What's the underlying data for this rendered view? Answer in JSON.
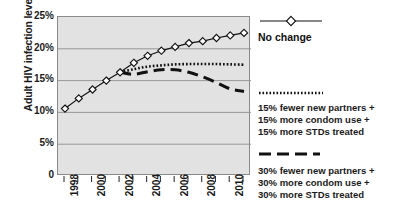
{
  "chart_data": {
    "type": "line",
    "title": "",
    "xlabel": "",
    "ylabel": "Adult HIV infection levels",
    "ylim": [
      0,
      25
    ],
    "ytick_labels": [
      "25%",
      "20%",
      "15%",
      "10%",
      "5%",
      "0"
    ],
    "ytick_values": [
      25,
      20,
      15,
      10,
      5,
      0
    ],
    "grid": true,
    "legend_position": "right",
    "x": [
      1998,
      1999,
      2000,
      2001,
      2002,
      2003,
      2004,
      2005,
      2006,
      2007,
      2008,
      2009,
      2010,
      2011
    ],
    "xtick_labels": [
      "1998",
      "",
      "2000",
      "",
      "2002",
      "",
      "2004",
      "",
      "2006",
      "",
      "2008",
      "",
      "2010",
      ""
    ],
    "xlim": [
      1998,
      2011
    ],
    "series": [
      {
        "name": "No change",
        "style": "solid-with-diamond-markers",
        "marker": "diamond",
        "x": [
          1998,
          1999,
          2000,
          2001,
          2002,
          2003,
          2004,
          2005,
          2006,
          2007,
          2008,
          2009,
          2010,
          2011
        ],
        "values": [
          10.6,
          12.2,
          13.6,
          15.0,
          16.3,
          17.8,
          18.9,
          19.7,
          20.3,
          20.9,
          21.2,
          21.7,
          22.1,
          22.5
        ]
      },
      {
        "name": "15% fewer new partners + 15% more condom use + 15% more STDs treated",
        "style": "dotted",
        "marker": "none",
        "x": [
          2002,
          2003,
          2004,
          2005,
          2006,
          2007,
          2008,
          2009,
          2010,
          2011
        ],
        "values": [
          16.3,
          16.8,
          17.2,
          17.4,
          17.55,
          17.6,
          17.6,
          17.6,
          17.55,
          17.5
        ]
      },
      {
        "name": "30% fewer new partners + 30% more condom use + 30% more STDs treated",
        "style": "dashed",
        "marker": "none",
        "x": [
          2002,
          2003,
          2004,
          2005,
          2006,
          2007,
          2008,
          2009,
          2010,
          2011
        ],
        "values": [
          16.3,
          16.0,
          16.4,
          16.7,
          16.7,
          16.3,
          15.6,
          14.7,
          13.7,
          13.3
        ]
      }
    ]
  },
  "axis": {
    "y_title": "Adult HIV infection levels",
    "y_ticks": [
      "25%",
      "20%",
      "15%",
      "10%",
      "5%",
      "0"
    ],
    "x_ticks": [
      "1998",
      "2000",
      "2002",
      "2004",
      "2006",
      "2008",
      "2010"
    ]
  },
  "legend": {
    "entries": [
      {
        "swatch": "solid-diamond-line",
        "label": "No change",
        "lines": [
          "No change"
        ]
      },
      {
        "swatch": "dotted-line",
        "label": "15% fewer new partners + 15% more condom use + 15% more STDs treated",
        "lines": [
          "15% fewer new partners +",
          "15% more condom use +",
          "15% more STDs treated"
        ]
      },
      {
        "swatch": "dashed-line",
        "label": "30% fewer new partners + 30% more condom use + 30% more STDs treated",
        "lines": [
          "30% fewer new partners +",
          "30% more condom use +",
          "30% more STDs treated"
        ]
      }
    ]
  },
  "colors": {
    "plot_background": "#e2e2e2",
    "grid": "#8f8f8f",
    "axis": "#555555",
    "series": "#111111",
    "text": "#1a1a1a",
    "page_background": "#ffffff"
  }
}
